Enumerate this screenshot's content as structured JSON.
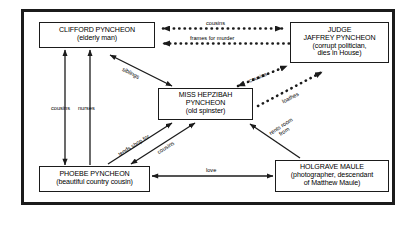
{
  "diagram": {
    "type": "relationship-diagram",
    "frame_color": "#1b1b1b",
    "background_color": "#ffffff",
    "nodes": [
      {
        "id": "clifford",
        "name": "CLIFFORD PYNCHEON",
        "detail": "(elderly man)"
      },
      {
        "id": "judge",
        "name_line1": "JUDGE",
        "name_line2": "JAFFREY PYNCHEON",
        "detail_line1": "(corrupt politician,",
        "detail_line2": "dies in House)"
      },
      {
        "id": "hepzibah",
        "name_line1": "MISS HEPZIBAH",
        "name_line2": "PYNCHEON",
        "detail": "(old spinster)"
      },
      {
        "id": "phoebe",
        "name": "PHOEBE PYNCHEON",
        "detail": "(beautiful country cousin)"
      },
      {
        "id": "holgrave",
        "name": "HOLGRAVE MAULE",
        "detail_line1": "(photographer, descendant",
        "detail_line2": "of Matthew Maule)"
      }
    ],
    "edges": [
      {
        "id": "clifford-judge-cousins",
        "label": "cousins",
        "from": "clifford",
        "to": "judge",
        "style": "dotted",
        "arrows": "both"
      },
      {
        "id": "judge-clifford-frames",
        "label": "frames for murder",
        "from": "judge",
        "to": "clifford",
        "style": "dotted",
        "arrows": "to-clifford"
      },
      {
        "id": "clifford-phoebe-cousins",
        "label": "cousins",
        "from": "phoebe",
        "to": "clifford",
        "style": "solid",
        "arrows": "both"
      },
      {
        "id": "phoebe-clifford-nurses",
        "label": "nurses",
        "from": "phoebe",
        "to": "clifford",
        "style": "solid",
        "arrows": "to-clifford"
      },
      {
        "id": "clifford-hepzibah-siblings",
        "label": "siblings",
        "from": "clifford",
        "to": "hepzibah",
        "style": "solid",
        "arrows": "both"
      },
      {
        "id": "hepzibah-judge-cousins",
        "label": "cousins",
        "from": "hepzibah",
        "to": "judge",
        "style": "dotted",
        "arrows": "both"
      },
      {
        "id": "hepzibah-judge-loathes",
        "label": "loathes",
        "from": "hepzibah",
        "to": "judge",
        "style": "dotted",
        "arrows": "to-judge"
      },
      {
        "id": "phoebe-hepzibah-tends",
        "label": "tends shop for",
        "from": "phoebe",
        "to": "hepzibah",
        "style": "solid",
        "arrows": "to-hepzibah"
      },
      {
        "id": "phoebe-hepzibah-cousins",
        "label": "cousins",
        "from": "phoebe",
        "to": "hepzibah",
        "style": "solid",
        "arrows": "both"
      },
      {
        "id": "holgrave-hepzibah-rents",
        "label_line1": "rents room",
        "label_line2": "from",
        "from": "holgrave",
        "to": "hepzibah",
        "style": "solid",
        "arrows": "to-hepzibah"
      },
      {
        "id": "phoebe-holgrave-love",
        "label": "love",
        "from": "phoebe",
        "to": "holgrave",
        "style": "solid",
        "arrows": "both"
      }
    ]
  }
}
